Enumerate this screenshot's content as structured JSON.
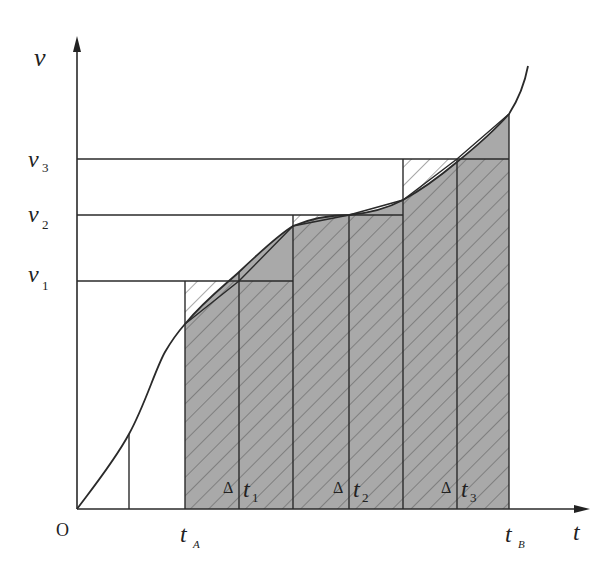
{
  "diagram": {
    "type": "velocity-time graph",
    "axes": {
      "x_label": "t",
      "y_label": "v",
      "origin_label": "O"
    },
    "y_levels": [
      {
        "label": "v",
        "sub": "1",
        "y": 281
      },
      {
        "label": "v",
        "sub": "2",
        "y": 215
      },
      {
        "label": "v",
        "sub": "3",
        "y": 159
      }
    ],
    "x_marks": [
      {
        "label": "t",
        "sub": "A",
        "x": 185
      },
      {
        "label": "t",
        "sub": "B",
        "x": 509
      }
    ],
    "intervals": [
      {
        "delta": "Δ",
        "label": "t",
        "sub": "1"
      },
      {
        "delta": "Δ",
        "label": "t",
        "sub": "2"
      },
      {
        "delta": "Δ",
        "label": "t",
        "sub": "3"
      }
    ],
    "colors": {
      "line": "#2a2a2a",
      "area_fill": "#a9a9a9",
      "hatch": "#555555",
      "background": "#ffffff"
    }
  }
}
